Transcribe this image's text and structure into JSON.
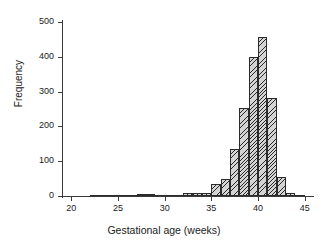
{
  "figure": {
    "background": "#ffffff",
    "bar_fill": "#d4d4d4",
    "bar_edge": "#2b2b2b",
    "axis_color": "#3a3a3a"
  },
  "chart_data": {
    "type": "bar",
    "title": "",
    "xlabel": "Gestational age (weeks)",
    "ylabel": "Frequency",
    "xlim": [
      19,
      46
    ],
    "ylim": [
      0,
      500
    ],
    "xticks": [
      20,
      25,
      30,
      35,
      40,
      45
    ],
    "yticks": [
      0,
      100,
      200,
      300,
      400,
      500
    ],
    "xtick_labels": [
      "20",
      "25",
      "30",
      "35",
      "40",
      "45"
    ],
    "ytick_labels": [
      "0",
      "100",
      "200",
      "300",
      "400",
      "500"
    ],
    "grid": false,
    "legend": null,
    "bin_width": 1,
    "categories": [
      20,
      21,
      22,
      23,
      24,
      25,
      26,
      27,
      28,
      29,
      30,
      31,
      32,
      33,
      34,
      35,
      36,
      37,
      38,
      39,
      40,
      41,
      42,
      43,
      44,
      45
    ],
    "values": [
      0,
      0,
      1,
      1,
      1,
      1,
      2,
      6,
      6,
      2,
      2,
      4,
      8,
      8,
      9,
      34,
      48,
      134,
      253,
      400,
      458,
      283,
      55,
      8,
      1,
      0
    ]
  }
}
